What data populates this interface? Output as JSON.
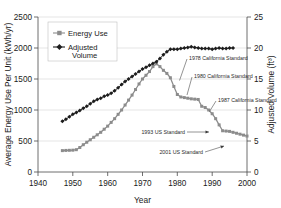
{
  "chart_data": {
    "type": "line",
    "title": "",
    "xlabel": "Year",
    "ylabel": "Average Energy Use Per Unit (kWh/yr)",
    "y2label": "Adjusted Volume (ft³)",
    "xlim": [
      1940,
      2000
    ],
    "ylim": [
      0,
      2500
    ],
    "y2lim": [
      0,
      25
    ],
    "xticks": [
      1940,
      1950,
      1960,
      1970,
      1980,
      1990,
      2000
    ],
    "yticks": [
      0,
      500,
      1000,
      1500,
      2000,
      2500
    ],
    "y2ticks": [
      0,
      5,
      10,
      15,
      20,
      25
    ],
    "grid": true,
    "legend_position": "upper-left-inside",
    "series": [
      {
        "name": "Energy Use",
        "axis": "left",
        "units": "kWh/yr",
        "marker": "square",
        "color": "#8c8c8c",
        "points": [
          [
            1947,
            345
          ],
          [
            1948,
            348
          ],
          [
            1949,
            350
          ],
          [
            1950,
            352
          ],
          [
            1951,
            360
          ],
          [
            1952,
            395
          ],
          [
            1953,
            440
          ],
          [
            1954,
            480
          ],
          [
            1955,
            520
          ],
          [
            1956,
            560
          ],
          [
            1957,
            600
          ],
          [
            1958,
            640
          ],
          [
            1959,
            690
          ],
          [
            1960,
            740
          ],
          [
            1961,
            800
          ],
          [
            1962,
            860
          ],
          [
            1963,
            930
          ],
          [
            1964,
            1000
          ],
          [
            1965,
            1080
          ],
          [
            1966,
            1160
          ],
          [
            1967,
            1240
          ],
          [
            1968,
            1330
          ],
          [
            1969,
            1420
          ],
          [
            1970,
            1500
          ],
          [
            1971,
            1560
          ],
          [
            1972,
            1620
          ],
          [
            1973,
            1700
          ],
          [
            1974,
            1745
          ],
          [
            1975,
            1700
          ],
          [
            1976,
            1640
          ],
          [
            1977,
            1590
          ],
          [
            1978,
            1520
          ],
          [
            1979,
            1380
          ],
          [
            1980,
            1250
          ],
          [
            1981,
            1210
          ],
          [
            1982,
            1200
          ],
          [
            1983,
            1190
          ],
          [
            1984,
            1180
          ],
          [
            1985,
            1175
          ],
          [
            1986,
            1170
          ],
          [
            1987,
            1060
          ],
          [
            1988,
            1040
          ],
          [
            1989,
            1000
          ],
          [
            1990,
            940
          ],
          [
            1991,
            860
          ],
          [
            1992,
            760
          ],
          [
            1993,
            665
          ],
          [
            1994,
            660
          ],
          [
            1995,
            655
          ],
          [
            1996,
            640
          ],
          [
            1997,
            625
          ],
          [
            1998,
            610
          ],
          [
            1999,
            595
          ],
          [
            2000,
            580
          ]
        ]
      },
      {
        "name": "Adjusted Volume",
        "axis": "right",
        "units": "ft³",
        "marker": "diamond",
        "color": "#1d1d1d",
        "points": [
          [
            1947,
            8.2
          ],
          [
            1948,
            8.5
          ],
          [
            1949,
            8.9
          ],
          [
            1950,
            9.3
          ],
          [
            1951,
            9.6
          ],
          [
            1952,
            9.9
          ],
          [
            1953,
            10.3
          ],
          [
            1954,
            10.6
          ],
          [
            1955,
            11.0
          ],
          [
            1956,
            11.4
          ],
          [
            1957,
            11.7
          ],
          [
            1958,
            11.9
          ],
          [
            1959,
            12.2
          ],
          [
            1960,
            12.4
          ],
          [
            1961,
            12.7
          ],
          [
            1962,
            13.1
          ],
          [
            1963,
            13.6
          ],
          [
            1964,
            14.1
          ],
          [
            1965,
            14.6
          ],
          [
            1966,
            15.0
          ],
          [
            1967,
            15.4
          ],
          [
            1968,
            15.8
          ],
          [
            1969,
            16.2
          ],
          [
            1970,
            16.6
          ],
          [
            1971,
            16.9
          ],
          [
            1972,
            17.2
          ],
          [
            1973,
            17.5
          ],
          [
            1974,
            17.8
          ],
          [
            1975,
            18.3
          ],
          [
            1976,
            18.9
          ],
          [
            1977,
            19.4
          ],
          [
            1978,
            19.8
          ],
          [
            1979,
            19.8
          ],
          [
            1980,
            19.8
          ],
          [
            1981,
            19.9
          ],
          [
            1982,
            20.0
          ],
          [
            1983,
            20.1
          ],
          [
            1984,
            20.2
          ],
          [
            1985,
            20.1
          ],
          [
            1986,
            20.0
          ],
          [
            1987,
            19.9
          ],
          [
            1988,
            19.9
          ],
          [
            1989,
            19.9
          ],
          [
            1990,
            19.8
          ],
          [
            1991,
            19.9
          ],
          [
            1992,
            20.0
          ],
          [
            1993,
            19.9
          ],
          [
            1994,
            19.9
          ],
          [
            1995,
            20.0
          ],
          [
            1996,
            20.0
          ]
        ]
      }
    ],
    "annotations": [
      {
        "label": "1978 California Standard",
        "target_year": 1979,
        "target_value": 1380
      },
      {
        "label": "1980 California Standard",
        "target_year": 1981,
        "target_value": 1210
      },
      {
        "label": "1987 California Standard",
        "target_year": 1987,
        "target_value": 1000
      },
      {
        "label": "1993 US Standard",
        "target_year": 1993,
        "target_value": 665
      },
      {
        "label": "2001 US Standard",
        "target_year": 1999,
        "target_value": 430
      }
    ]
  }
}
